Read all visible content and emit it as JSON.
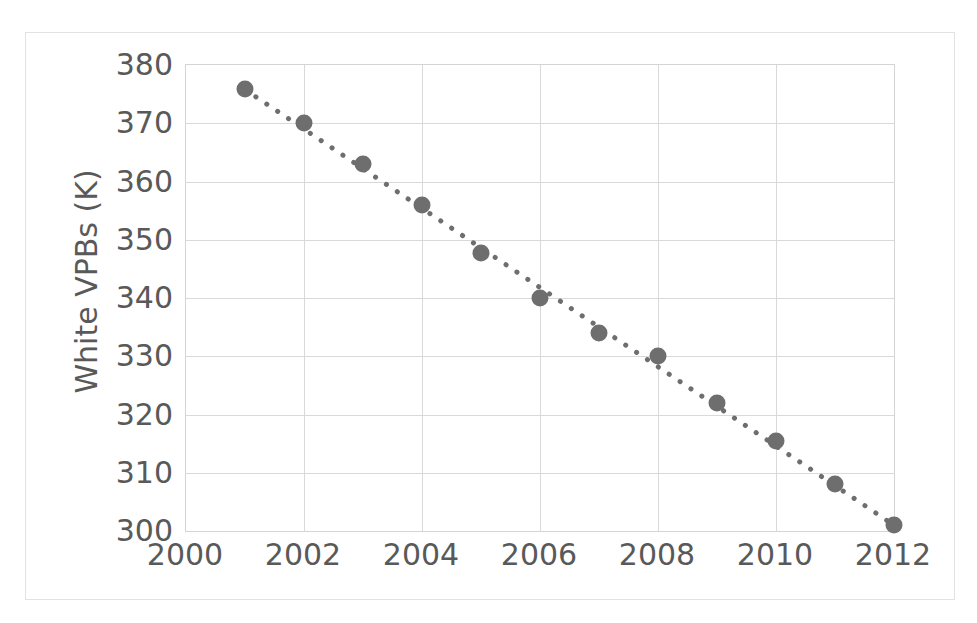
{
  "chart_data": {
    "type": "scatter",
    "title": "",
    "xlabel": "",
    "ylabel": "White VPBs (K)",
    "x": [
      2001,
      2002,
      2003,
      2004,
      2005,
      2006,
      2007,
      2008,
      2009,
      2010,
      2011,
      2012
    ],
    "values": [
      375.8,
      370.0,
      363.0,
      356.0,
      347.7,
      340.0,
      334.0,
      330.0,
      322.0,
      315.5,
      308.0,
      301.0
    ],
    "series": [
      {
        "name": "White VPBs (K)",
        "values": [
          375.8,
          370.0,
          363.0,
          356.0,
          347.7,
          340.0,
          334.0,
          330.0,
          322.0,
          315.5,
          308.0,
          301.0
        ],
        "marker_color": "#6e6e6e",
        "marker_shape": "circle"
      }
    ],
    "trendline": {
      "present": true,
      "style": "dotted",
      "color": "#6e6e6e",
      "from": {
        "x": 2001,
        "y": 375.8
      },
      "to": {
        "x": 2012,
        "y": 301.0
      }
    },
    "xlim": [
      2000,
      2012
    ],
    "ylim": [
      300,
      380
    ],
    "xticks": [
      "2000",
      "2002",
      "2004",
      "2006",
      "2008",
      "2010",
      "2012"
    ],
    "xtick_values": [
      2000,
      2002,
      2004,
      2006,
      2008,
      2010,
      2012
    ],
    "yticks": [
      "300",
      "310",
      "320",
      "330",
      "340",
      "350",
      "360",
      "370",
      "380"
    ],
    "ytick_values": [
      300,
      310,
      320,
      330,
      340,
      350,
      360,
      370,
      380
    ],
    "grid": {
      "horizontal": true,
      "vertical": true,
      "color": "#d9d9d9"
    },
    "legend": {
      "visible": false,
      "position": "none"
    },
    "colors": {
      "marker": "#6e6e6e",
      "gridline": "#d9d9d9",
      "axis_border": "#d4d4d4",
      "tick_text": "#595959",
      "frame": "#e2e2e2",
      "background": "#ffffff"
    }
  }
}
